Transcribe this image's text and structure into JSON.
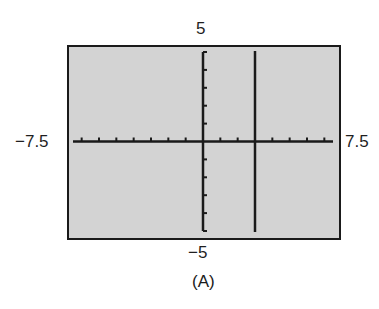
{
  "chart_data": {
    "type": "line",
    "title": "",
    "caption": "(A)",
    "window": {
      "xmin": -7.5,
      "xmax": 7.5,
      "ymin": -5,
      "ymax": 5,
      "xscl": 1,
      "yscl": 1
    },
    "labels": {
      "ymax": "5",
      "ymin": "−5",
      "xmin": "−7.5",
      "xmax": "7.5"
    },
    "series": [
      {
        "name": "vertical line x = 3",
        "kind": "vertical-line",
        "x": 3,
        "y_range": [
          -5,
          5
        ]
      }
    ],
    "grid": false,
    "colors": {
      "background": "#d3d3d3",
      "axes": "#1a1a1a",
      "graph": "#1a1a1a"
    }
  }
}
